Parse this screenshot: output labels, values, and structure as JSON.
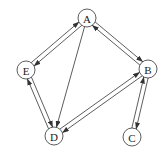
{
  "diagram": {
    "type": "directed-graph",
    "node_radius": 9,
    "colors": {
      "stroke": "#333333",
      "fill": "#ffffff",
      "text": "#222222"
    },
    "nodes": [
      {
        "id": "A",
        "label": "A",
        "x": 87,
        "y": 18
      },
      {
        "id": "B",
        "label": "B",
        "x": 148,
        "y": 69
      },
      {
        "id": "C",
        "label": "C",
        "x": 132,
        "y": 137
      },
      {
        "id": "D",
        "label": "D",
        "x": 54,
        "y": 136
      },
      {
        "id": "E",
        "label": "E",
        "x": 26,
        "y": 70
      }
    ],
    "edges": [
      {
        "from": "A",
        "to": "B",
        "offset": -2.2
      },
      {
        "from": "B",
        "to": "A",
        "offset": -2.2
      },
      {
        "from": "A",
        "to": "E",
        "offset": -2.2
      },
      {
        "from": "E",
        "to": "A",
        "offset": -2.2
      },
      {
        "from": "A",
        "to": "D",
        "offset": 0
      },
      {
        "from": "B",
        "to": "C",
        "offset": -2.2
      },
      {
        "from": "C",
        "to": "B",
        "offset": -2.2
      },
      {
        "from": "B",
        "to": "D",
        "offset": -2.2
      },
      {
        "from": "D",
        "to": "B",
        "offset": -2.2
      },
      {
        "from": "D",
        "to": "E",
        "offset": -2.2
      },
      {
        "from": "E",
        "to": "D",
        "offset": -2.2
      }
    ]
  }
}
